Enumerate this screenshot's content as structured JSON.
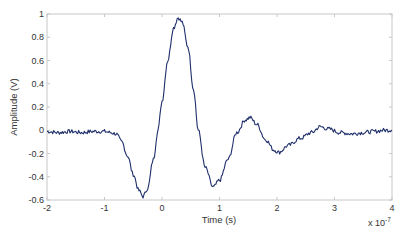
{
  "chart_data": {
    "type": "line",
    "title": "",
    "xlabel": "Time (s)",
    "ylabel": "Amplitude (V)",
    "x_multiplier_label": "x 10",
    "x_multiplier_exponent": "-7",
    "xlim": [
      -2,
      4
    ],
    "ylim": [
      -0.6,
      1
    ],
    "grid": false,
    "legend": null,
    "x_ticks": [
      -2,
      -1,
      0,
      1,
      2,
      3,
      4
    ],
    "x_tick_labels": [
      "-2",
      "-1",
      "0",
      "1",
      "2",
      "3",
      "4"
    ],
    "y_ticks": [
      -0.6,
      -0.4,
      -0.2,
      0,
      0.2,
      0.4,
      0.6,
      0.8,
      1
    ],
    "y_tick_labels": [
      "-0.6",
      "-0.4",
      "-0.2",
      "0",
      "0.2",
      "0.4",
      "0.6",
      "0.8",
      "1"
    ],
    "line_color": "#1f2f6b",
    "series": [
      {
        "name": "Amplitude",
        "x": [
          -2.0,
          -1.8,
          -1.6,
          -1.4,
          -1.2,
          -1.0,
          -0.9,
          -0.8,
          -0.7,
          -0.6,
          -0.5,
          -0.4,
          -0.33,
          -0.25,
          -0.15,
          -0.07,
          0.0,
          0.1,
          0.2,
          0.28,
          0.35,
          0.45,
          0.55,
          0.63,
          0.75,
          0.89,
          1.0,
          1.15,
          1.3,
          1.45,
          1.53,
          1.65,
          1.8,
          1.95,
          2.03,
          2.2,
          2.4,
          2.6,
          2.75,
          2.9,
          3.1,
          3.3,
          3.5,
          3.7,
          3.85,
          4.0
        ],
        "y": [
          -0.01,
          -0.02,
          -0.01,
          -0.02,
          -0.01,
          -0.01,
          -0.02,
          -0.03,
          -0.1,
          -0.22,
          -0.38,
          -0.52,
          -0.57,
          -0.5,
          -0.25,
          0.0,
          0.25,
          0.6,
          0.88,
          0.97,
          0.93,
          0.72,
          0.35,
          0.0,
          -0.32,
          -0.49,
          -0.43,
          -0.25,
          -0.02,
          0.09,
          0.11,
          0.05,
          -0.08,
          -0.17,
          -0.19,
          -0.13,
          -0.07,
          -0.02,
          0.03,
          0.01,
          -0.02,
          -0.03,
          -0.02,
          -0.01,
          0.0,
          0.0
        ]
      }
    ]
  }
}
